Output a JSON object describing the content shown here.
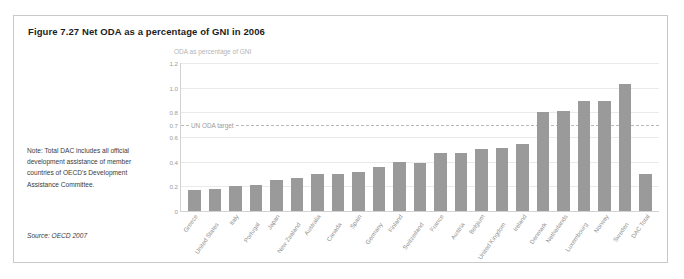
{
  "figure": {
    "title": "Figure 7.27 Net ODA as a percentage of GNI in 2006",
    "note": "Note: Total DAC includes all official development assistance of member countries of OECD's Development Assistance Committee.",
    "source": "Source: OECD 2007"
  },
  "chart_data": {
    "type": "bar",
    "title": "Figure 7.27 Net ODA as a percentage of GNI in 2006",
    "subtitle": "ODA as percentage of GNI",
    "xlabel": "",
    "ylabel": "ODA as percentage of GNI",
    "ylim": [
      0,
      1.2
    ],
    "yticks": [
      "0",
      "0.2",
      "0.4",
      "0.6",
      "0.7",
      "0.8",
      "1.0",
      "1.2"
    ],
    "ytick_values": [
      0,
      0.2,
      0.4,
      0.6,
      0.7,
      0.8,
      1.0,
      1.2
    ],
    "gridlines": [
      0.2,
      0.4,
      0.6,
      0.8,
      1.0,
      1.2
    ],
    "grid": true,
    "legend": "none",
    "bar_color": "#9a9a9a",
    "annotation": {
      "label": "UN ODA target",
      "value": 0.7,
      "style": "dashed"
    },
    "categories": [
      "Greece",
      "United States",
      "Italy",
      "Portugal",
      "Japan",
      "New Zealand",
      "Australia",
      "Canada",
      "Spain",
      "Germany",
      "Finland",
      "Switzerland",
      "France",
      "Austria",
      "Belgium",
      "United Kingdom",
      "Ireland",
      "Denmark",
      "Netherlands",
      "Luxembourg",
      "Norway",
      "Sweden",
      "DAC Total"
    ],
    "values": [
      0.17,
      0.18,
      0.2,
      0.21,
      0.25,
      0.27,
      0.3,
      0.3,
      0.32,
      0.36,
      0.4,
      0.39,
      0.47,
      0.47,
      0.5,
      0.51,
      0.54,
      0.8,
      0.81,
      0.89,
      0.89,
      1.03,
      0.3
    ]
  }
}
